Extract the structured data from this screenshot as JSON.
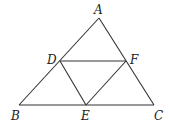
{
  "diagram": {
    "type": "geometry",
    "points": {
      "A": {
        "label": "A",
        "x": 99,
        "y": 18,
        "lx": 94,
        "ly": 14
      },
      "B": {
        "label": "B",
        "x": 19,
        "y": 105,
        "lx": 11,
        "ly": 120
      },
      "C": {
        "label": "C",
        "x": 154,
        "y": 105,
        "lx": 154,
        "ly": 120
      },
      "D": {
        "label": "D",
        "x": 60,
        "y": 61,
        "lx": 47,
        "ly": 64
      },
      "E": {
        "label": "E",
        "x": 86,
        "y": 105,
        "lx": 81,
        "ly": 120
      },
      "F": {
        "label": "F",
        "x": 126,
        "y": 61,
        "lx": 130,
        "ly": 64
      }
    },
    "segments": [
      [
        "A",
        "B"
      ],
      [
        "A",
        "C"
      ],
      [
        "B",
        "C"
      ],
      [
        "D",
        "F"
      ],
      [
        "D",
        "E"
      ],
      [
        "E",
        "F"
      ]
    ]
  }
}
